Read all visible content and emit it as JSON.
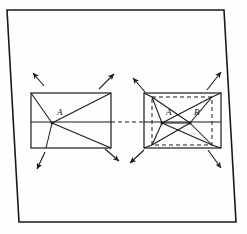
{
  "figure": {
    "background_color": "#fefefe",
    "ink_color": "#1a1a1a",
    "frame": {
      "name": "outer-border-quadrilateral",
      "points": "7,10 224,10 236,222 19,222",
      "stroke_width": 1.6
    },
    "left_figure": {
      "name": "left-rectangle-figure",
      "rect": {
        "x1": 31,
        "y1": 93,
        "x2": 111,
        "y2": 148
      },
      "midline": {
        "x1": 31,
        "y1": 122,
        "x2": 111,
        "y2": 122
      },
      "vertex": {
        "x": 52,
        "y": 123,
        "label": "A",
        "label_x": 57,
        "label_y": 115
      },
      "rays": [
        {
          "name": "ray-to-top-left-corner",
          "x2": 31,
          "y2": 93
        },
        {
          "name": "ray-to-top-right-corner",
          "x2": 111,
          "y2": 93
        },
        {
          "name": "ray-to-bottom-left",
          "x2": 46,
          "y2": 148
        },
        {
          "name": "ray-to-bottom-right-corner",
          "x2": 111,
          "y2": 148
        }
      ],
      "arrows": [
        {
          "name": "arrow-up-left",
          "x1": 44,
          "y1": 86,
          "x2": 33,
          "y2": 73
        },
        {
          "name": "arrow-up-right",
          "x1": 99,
          "y1": 89,
          "x2": 114,
          "y2": 74
        },
        {
          "name": "arrow-down-left",
          "x1": 45,
          "y1": 152,
          "x2": 37,
          "y2": 169
        },
        {
          "name": "arrow-down-right",
          "x1": 105,
          "y1": 149,
          "x2": 119,
          "y2": 161
        }
      ]
    },
    "right_figure": {
      "name": "right-rectangle-figure",
      "rect": {
        "x1": 144,
        "y1": 93,
        "x2": 221,
        "y2": 148
      },
      "midline": {
        "x1": 144,
        "y1": 122,
        "x2": 221,
        "y2": 122
      },
      "inner_dashed_rect": {
        "x1": 152,
        "y1": 97,
        "x2": 212,
        "y2": 145
      },
      "vertices": [
        {
          "x": 162,
          "y": 123,
          "label": "A",
          "label_x": 166,
          "label_y": 115
        },
        {
          "x": 190,
          "y": 123,
          "label": "B",
          "label_x": 194,
          "label_y": 115
        }
      ],
      "diagonals": [
        {
          "name": "diagonal-A-to-top-right",
          "x1": 162,
          "y1": 123,
          "x2": 212,
          "y2": 97
        },
        {
          "name": "diagonal-A-to-bottom-right",
          "x1": 162,
          "y1": 123,
          "x2": 212,
          "y2": 145
        },
        {
          "name": "diagonal-B-to-top-left",
          "x1": 190,
          "y1": 123,
          "x2": 152,
          "y2": 97
        },
        {
          "name": "diagonal-B-to-bottom-left",
          "x1": 190,
          "y1": 123,
          "x2": 152,
          "y2": 145
        },
        {
          "name": "segment-A-to-B",
          "x1": 162,
          "y1": 123,
          "x2": 190,
          "y2": 123
        },
        {
          "name": "edge-A-to-top-left",
          "x1": 162,
          "y1": 123,
          "x2": 152,
          "y2": 97
        },
        {
          "name": "edge-A-to-bottom-left",
          "x1": 162,
          "y1": 123,
          "x2": 152,
          "y2": 145
        },
        {
          "name": "edge-B-to-top-right",
          "x1": 190,
          "y1": 123,
          "x2": 212,
          "y2": 97
        },
        {
          "name": "edge-B-to-bottom-right",
          "x1": 190,
          "y1": 123,
          "x2": 212,
          "y2": 145
        }
      ],
      "corner_rays": [
        {
          "name": "corner-ray-top-left",
          "x1": 152,
          "y1": 97,
          "x2": 144,
          "y2": 93
        },
        {
          "name": "corner-ray-top-right",
          "x1": 212,
          "y1": 97,
          "x2": 221,
          "y2": 93
        },
        {
          "name": "corner-ray-bottom-left",
          "x1": 152,
          "y1": 145,
          "x2": 144,
          "y2": 148
        },
        {
          "name": "corner-ray-bottom-right",
          "x1": 212,
          "y1": 145,
          "x2": 221,
          "y2": 148
        }
      ],
      "arrows": [
        {
          "name": "arrow-up-left",
          "x1": 145,
          "y1": 92,
          "x2": 133,
          "y2": 78
        },
        {
          "name": "arrow-up-right",
          "x1": 207,
          "y1": 90,
          "x2": 221,
          "y2": 72
        },
        {
          "name": "arrow-down-left",
          "x1": 144,
          "y1": 150,
          "x2": 130,
          "y2": 163
        },
        {
          "name": "arrow-down-right",
          "x1": 208,
          "y1": 150,
          "x2": 221,
          "y2": 168
        }
      ]
    },
    "connector": {
      "name": "dashed-connector-between-figures",
      "x1": 111,
      "y1": 122,
      "x2": 144,
      "y2": 122,
      "style": "dashed"
    }
  }
}
